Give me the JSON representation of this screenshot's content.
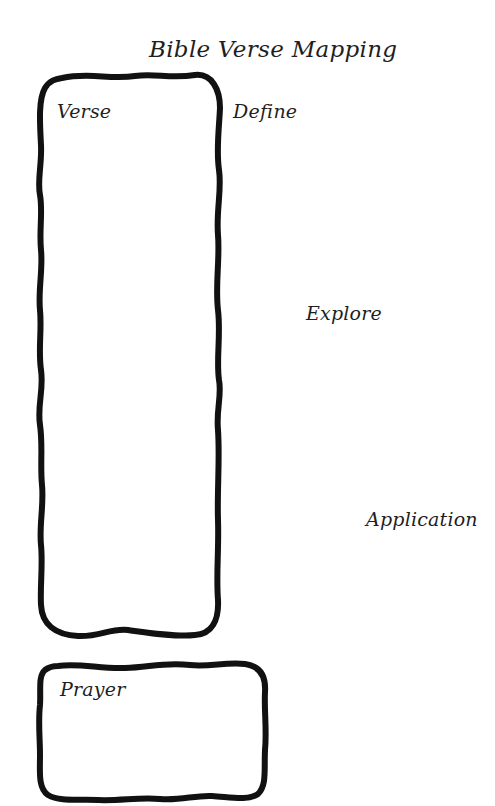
{
  "worksheet": {
    "title": "Bible Verse Mapping",
    "sections": {
      "verse": "Verse",
      "define": "Define",
      "explore": "Explore",
      "application": "Application",
      "prayer": "Prayer"
    },
    "colors": {
      "background": "#ffffff",
      "ink": "#1a1a1a"
    }
  }
}
